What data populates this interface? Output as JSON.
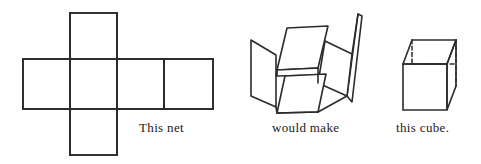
{
  "figure": {
    "background_color": "#ffffff",
    "stroke_color": "#2b2b2b",
    "stroke_width": 1.6,
    "captions": {
      "net": "This net",
      "fold": "would make",
      "cube": "this cube."
    },
    "panels": [
      {
        "name": "net",
        "label": "This net",
        "description": "Flat cross-shaped net of six squares",
        "square_count": 6,
        "layout": "cross",
        "squares": [
          {
            "id": "top",
            "x": 70,
            "y": 13,
            "w": 47,
            "h": 46
          },
          {
            "id": "left",
            "x": 23,
            "y": 59,
            "w": 47,
            "h": 50
          },
          {
            "id": "center",
            "x": 70,
            "y": 59,
            "w": 47,
            "h": 50
          },
          {
            "id": "right1",
            "x": 117,
            "y": 59,
            "w": 47,
            "h": 50
          },
          {
            "id": "right2",
            "x": 164,
            "y": 59,
            "w": 49,
            "h": 50
          },
          {
            "id": "bottom",
            "x": 70,
            "y": 109,
            "w": 47,
            "h": 46
          }
        ]
      },
      {
        "name": "folding",
        "label": "would make",
        "description": "Partially folded open box with raised flaps",
        "face_count": 6
      },
      {
        "name": "cube",
        "label": "this cube.",
        "description": "Completed cube drawn in oblique projection with dashed hidden edges",
        "hidden_edges_style": "dashed",
        "visible_faces": 3
      }
    ]
  }
}
